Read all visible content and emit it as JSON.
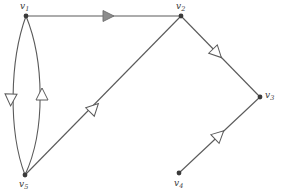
{
  "figure": {
    "kind": "directed-graph-diagram",
    "width": 281,
    "height": 195,
    "background": "#ffffff",
    "edge_color": "#5a5a5a",
    "node_color": "#3a3a3a",
    "label_color": "#3a3a3a",
    "filled_arrow_color": "#8c8c8c"
  },
  "nodes": [
    {
      "id": "v1",
      "label": "v",
      "sub": "1",
      "x": 26,
      "y": 16,
      "label_x": 20,
      "label_y": 2
    },
    {
      "id": "v2",
      "label": "v",
      "sub": "2",
      "x": 181,
      "y": 16,
      "label_x": 176,
      "label_y": 2
    },
    {
      "id": "v3",
      "label": "v",
      "sub": "3",
      "x": 260,
      "y": 97,
      "label_x": 265,
      "label_y": 91
    },
    {
      "id": "v4",
      "label": "v",
      "sub": "4",
      "x": 179,
      "y": 173,
      "label_x": 174,
      "label_y": 179
    },
    {
      "id": "v5",
      "label": "v",
      "sub": "5",
      "x": 25,
      "y": 175,
      "label_x": 19,
      "label_y": 180
    }
  ],
  "edges": [
    {
      "id": "e-v1-v2",
      "from": "v1",
      "to": "v2",
      "shape": "straight",
      "arrow": "filled",
      "arrow_direction": "right"
    },
    {
      "id": "e-v1-v5",
      "from": "v1",
      "to": "v5",
      "shape": "curved-left",
      "arrow": "hollow",
      "arrow_direction": "down"
    },
    {
      "id": "e-v5-v1",
      "from": "v5",
      "to": "v1",
      "shape": "curved-right",
      "arrow": "hollow",
      "arrow_direction": "up"
    },
    {
      "id": "e-v5-v2",
      "from": "v5",
      "to": "v2",
      "shape": "straight",
      "arrow": "hollow",
      "arrow_direction": "up-right"
    },
    {
      "id": "e-v2-v3",
      "from": "v2",
      "to": "v3",
      "shape": "straight",
      "arrow": "hollow",
      "arrow_direction": "down-right"
    },
    {
      "id": "e-v4-v3",
      "from": "v4",
      "to": "v3",
      "shape": "straight",
      "arrow": "hollow",
      "arrow_direction": "up-right"
    }
  ]
}
